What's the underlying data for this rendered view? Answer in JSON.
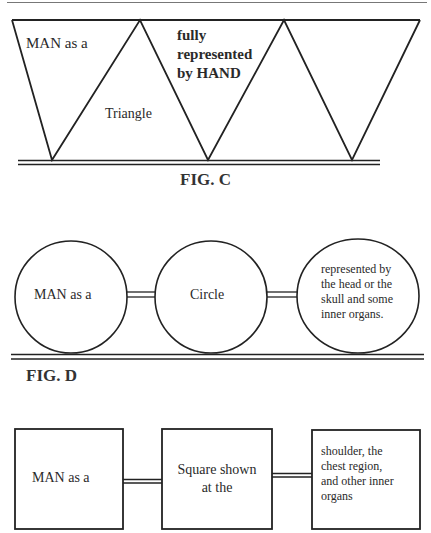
{
  "fig_c": {
    "caption": "FIG. C",
    "labels": {
      "man_as_a": "MAN as a",
      "triangle": "Triangle",
      "fully": "fully",
      "represented": "represented",
      "by_hand": "by HAND"
    }
  },
  "fig_d": {
    "caption": "FIG. D",
    "labels": {
      "man_as_a": "MAN as a",
      "circle": "Circle",
      "desc_line1": "represented by",
      "desc_line2": "the head or the",
      "desc_line3": "skull and some",
      "desc_line4": "inner organs."
    }
  },
  "fig_e": {
    "labels": {
      "man_as_a": "MAN as a",
      "square_line1": "Square shown",
      "square_line2": "at the",
      "desc_line1": "shoulder, the",
      "desc_line2": "chest region,",
      "desc_line3": "and other inner",
      "desc_line4": "organs"
    }
  },
  "colors": {
    "stroke": "#222222",
    "text": "#2a2a2a",
    "background": "#ffffff"
  }
}
